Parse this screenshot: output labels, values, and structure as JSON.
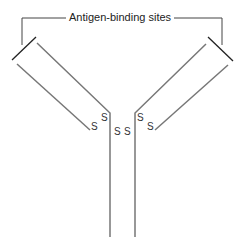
{
  "title": "Antigen-binding sites",
  "labels": {
    "s1": "S",
    "s2": "S",
    "s3": "S",
    "s4": "S",
    "s5": "S",
    "s6": "S",
    "s7": "S",
    "s8": "S"
  },
  "colors": {
    "chain": "#777777",
    "bracket": "#444444",
    "cap": "#222222"
  }
}
